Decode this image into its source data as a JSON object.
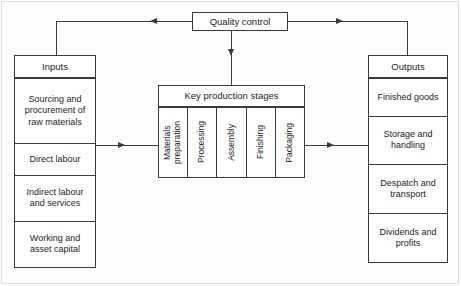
{
  "diagram": {
    "quality_control": {
      "label": "Quality control"
    },
    "inputs": {
      "header": "Inputs",
      "items": [
        "Sourcing and procurement of raw materials",
        "Direct labour",
        "Indirect labour and services",
        "Working and asset capital"
      ]
    },
    "stages": {
      "header": "Key production stages",
      "items": [
        "Materials preparation",
        "Processing",
        "Assembly",
        "Finishing",
        "Packaging"
      ]
    },
    "outputs": {
      "header": "Outputs",
      "items": [
        "Finished goods",
        "Storage and handling",
        "Despatch and transport",
        "Dividends and profits"
      ]
    },
    "colors": {
      "stroke": "#3a3a3a",
      "background": "#ffffff",
      "text": "#1c1c1c"
    }
  }
}
